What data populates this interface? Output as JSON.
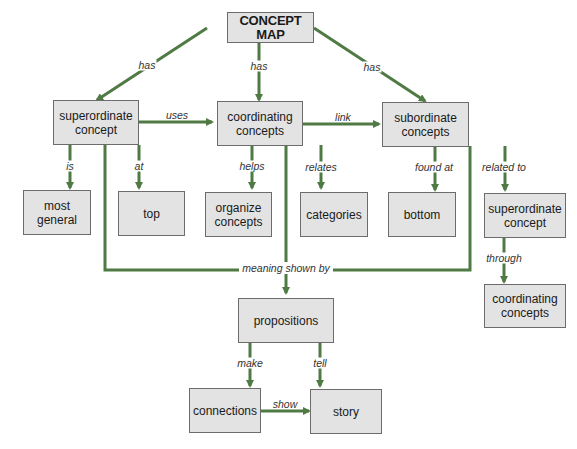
{
  "title": "CONCEPT MAP",
  "colors": {
    "line": "#4f7a44",
    "box_fill": "#e3e3e3",
    "box_border": "#6c6c6c"
  },
  "nodes": {
    "concept_map": "CONCEPT MAP",
    "superordinate": "superordinate concept",
    "coordinating": "coordinating concepts",
    "subordinate": "subordinate concepts",
    "most_general": "most general",
    "top": "top",
    "organize": "organize concepts",
    "categories": "categories",
    "bottom": "bottom",
    "superordinate2": "superordinate concept",
    "coordinating2": "coordinating concepts",
    "propositions": "propositions",
    "connections": "connections",
    "story": "story"
  },
  "links": {
    "has_left": "has",
    "has_mid": "has",
    "has_right": "has",
    "uses": "uses",
    "link": "link",
    "is": "is",
    "at": "at",
    "helps": "helps",
    "relates": "relates",
    "found_at": "found at",
    "related_to": "related to",
    "through": "through",
    "meaning_shown_by": "meaning shown by",
    "make": "make",
    "tell": "tell",
    "show": "show"
  }
}
